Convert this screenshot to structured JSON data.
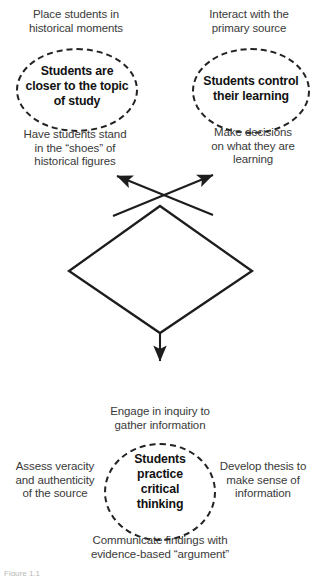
{
  "figure": {
    "title": "Why are Primary Sources Valuable?",
    "type": "concept-flow-diagram",
    "background_color": "#ffffff",
    "text_color": "#3a3a3a",
    "bold_text_color": "#111111",
    "line_color": "#222222"
  },
  "top_left_cluster": {
    "caption_above": "Place students in\nhistorical moments",
    "core_label": "Students are\ncloser to the topic\nof study",
    "caption_below": "Have students stand\nin the “shoes” of\nhistorical figures"
  },
  "top_right_cluster": {
    "caption_above": "Interact with the\nprimary source",
    "core_label": "Students control\ntheir learning",
    "caption_below": "Make decisions\non what they are\nlearning"
  },
  "center": {
    "label": "Why are\nPrimary Sources\nValuable?"
  },
  "bottom_cluster": {
    "caption_above": "Engage in inquiry to\ngather information",
    "core_label": "Students\npractice\ncritical\nthinking",
    "caption_left": "Assess veracity\nand authenticity\nof  the source",
    "caption_right": "Develop thesis to\nmake sense of\ninformation",
    "caption_below": "Communicate findings with\nevidence-based “argument”"
  },
  "footer": {
    "cutoff_caption": "Figure 1.1"
  },
  "arrows": {
    "up_left": "arrow-to-top-left-cluster",
    "up_right": "arrow-to-top-right-cluster",
    "down": "arrow-to-bottom-cluster"
  }
}
